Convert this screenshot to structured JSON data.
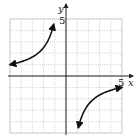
{
  "chart_data": {
    "type": "line",
    "title": "",
    "xlabel": "x",
    "ylabel": "y",
    "xlim": [
      -5,
      5
    ],
    "ylim": [
      -5,
      5
    ],
    "grid": true,
    "tick_labels": {
      "x": [
        "5"
      ],
      "y": [
        "5"
      ]
    },
    "function": "y = -5/x",
    "series": [
      {
        "name": "left branch",
        "x": [
          -5,
          -4,
          -3,
          -2.5,
          -2,
          -1.5,
          -1.2,
          -1.1
        ],
        "y": [
          1,
          1.25,
          1.67,
          2,
          2.5,
          3.33,
          4.17,
          4.5
        ]
      },
      {
        "name": "right branch",
        "x": [
          1.1,
          1.2,
          1.5,
          2,
          2.5,
          3,
          4,
          5
        ],
        "y": [
          -4.5,
          -4.17,
          -3.33,
          -2.5,
          -2,
          -1.67,
          -1.25,
          -1
        ]
      }
    ],
    "arrows_at_ends": true
  },
  "labels": {
    "x_axis": "x",
    "y_axis": "y",
    "x_tick": "5",
    "y_tick": "5"
  },
  "colors": {
    "curve": "#111111",
    "axis": "#222222",
    "grid": "#bbbbbb"
  }
}
